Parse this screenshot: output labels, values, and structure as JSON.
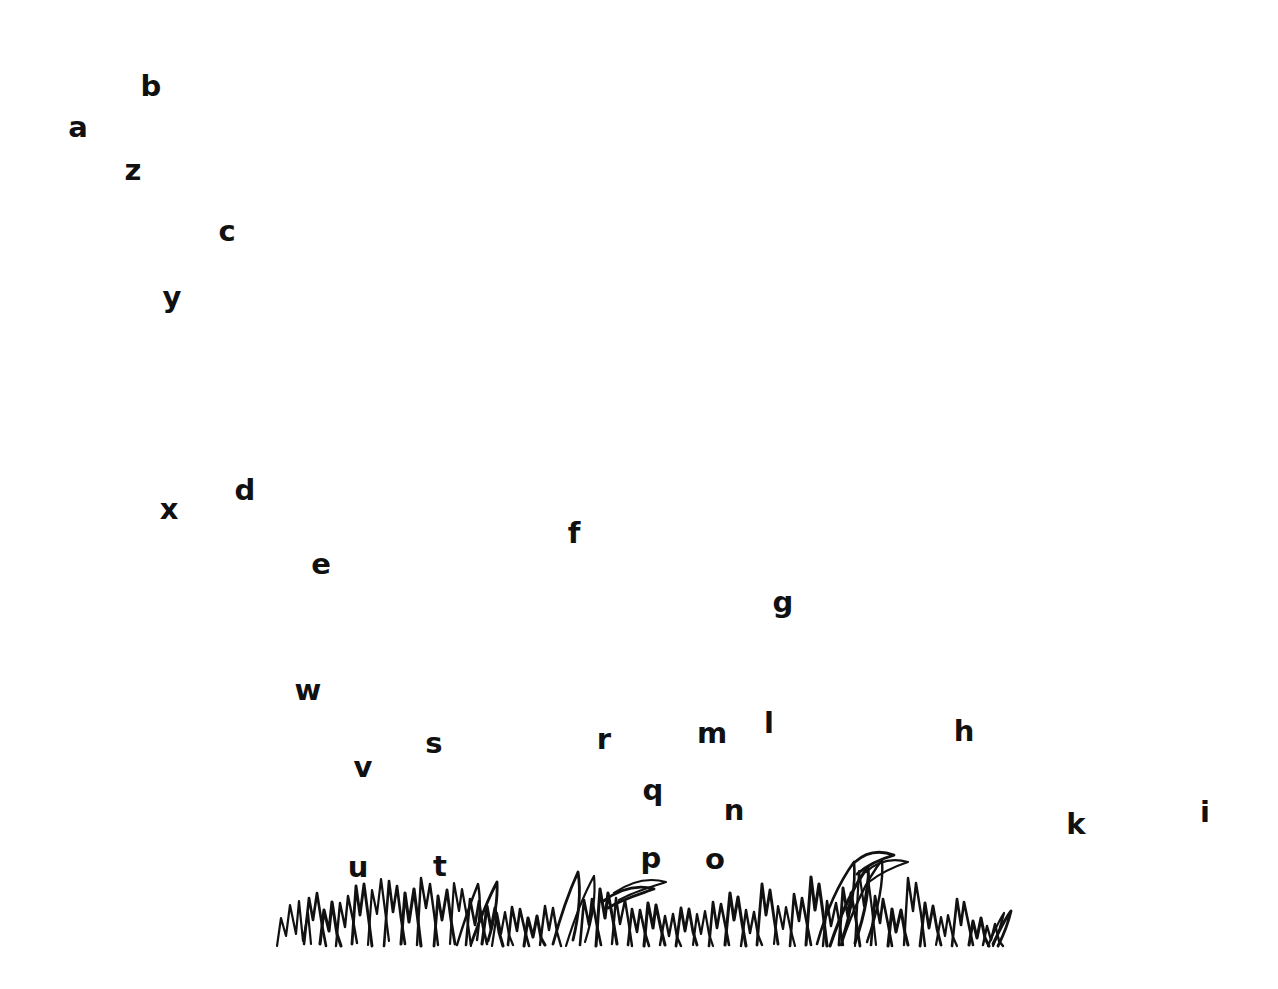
{
  "image": {
    "title": "Hand-drawn grass sketch with scattered alphabet labels",
    "background_color": "#ffffff",
    "ink_color": "#111111",
    "width": 1278,
    "height": 989
  },
  "letters": [
    {
      "label": "b",
      "x": 151,
      "y": 86
    },
    {
      "label": "a",
      "x": 78,
      "y": 127
    },
    {
      "label": "z",
      "x": 133,
      "y": 170
    },
    {
      "label": "c",
      "x": 227,
      "y": 231
    },
    {
      "label": "y",
      "x": 172,
      "y": 297
    },
    {
      "label": "d",
      "x": 245,
      "y": 490
    },
    {
      "label": "x",
      "x": 169,
      "y": 509
    },
    {
      "label": "f",
      "x": 574,
      "y": 533
    },
    {
      "label": "e",
      "x": 321,
      "y": 564
    },
    {
      "label": "g",
      "x": 783,
      "y": 602
    },
    {
      "label": "w",
      "x": 308,
      "y": 690
    },
    {
      "label": "l",
      "x": 769,
      "y": 723
    },
    {
      "label": "h",
      "x": 964,
      "y": 731
    },
    {
      "label": "m",
      "x": 712,
      "y": 733
    },
    {
      "label": "r",
      "x": 604,
      "y": 739
    },
    {
      "label": "s",
      "x": 434,
      "y": 743
    },
    {
      "label": "v",
      "x": 363,
      "y": 767
    },
    {
      "label": "q",
      "x": 653,
      "y": 790
    },
    {
      "label": "n",
      "x": 734,
      "y": 810
    },
    {
      "label": "i",
      "x": 1205,
      "y": 812
    },
    {
      "label": "k",
      "x": 1076,
      "y": 824
    },
    {
      "label": "p",
      "x": 651,
      "y": 858
    },
    {
      "label": "o",
      "x": 715,
      "y": 859
    },
    {
      "label": "u",
      "x": 358,
      "y": 867
    },
    {
      "label": "t",
      "x": 440,
      "y": 866
    }
  ],
  "grass": {
    "name": "grass-tuft-drawing",
    "stroke_color": "#111111",
    "baseline_y": 945,
    "x_start": 277,
    "x_end": 1012,
    "description": "Hand-inked clump of grass blades spanning the lower-centre of the page",
    "blades": [
      "M277,946 L281,918 L286,936 L290,905 L296,934 L299,901 L303,941 L308,913 L311,944",
      "M304,944 L309,898 L313,920 L317,893 L322,925 L326,946",
      "M320,944 L324,910 L329,931 L332,902 L337,934 L341,946",
      "M336,946 L340,903 L345,927 L348,896 L353,920 L357,943",
      "M352,944 L356,886 L360,915 L364,884 L369,922 L372,946",
      "M368,945 L372,890 L377,914 L381,879 L385,910 L389,941",
      "M384,946 L389,881 L393,912 L397,886 L401,918 L405,944",
      "M401,944 L405,893 L409,922 L414,889 L418,921 L421,946",
      "M417,945 L421,878 L426,908 L430,884 L434,913 L438,945",
      "M434,946 L438,896 L442,920 L447,890 L451,920 L455,944",
      "M450,944 L454,883 L459,911 L462,889 L467,917 L471,946",
      "M466,945 L470,899 L475,925 L479,901 L483,927 L487,944",
      "M482,944 L487,906 L491,929 L495,908 L499,932 L503,946",
      "M457,945 C463,925 470,904 478,884 C481,899 480,918 477,940",
      "M471,944 C479,922 487,901 497,882 C498,900 494,921 488,941",
      "M492,946 L497,913 L501,934 L505,912 L509,935 L513,945",
      "M508,945 L512,907 L517,931 L520,909 L525,931 L529,946",
      "M524,946 L528,918 L533,937 L537,916 L541,938 L545,945",
      "M540,945 L545,906 L549,930 L553,908 L557,932 L561,946",
      "M553,944 C560,918 568,894 578,872 C581,891 579,915 573,940",
      "M566,946 C574,920 583,896 594,876 C596,896 592,920 585,942",
      "M580,945 L584,900 L589,925 L592,899 L597,926 L601,945",
      "M596,946 L600,889 L605,918 L608,893 L613,920 L617,944",
      "M612,944 L616,898 L620,924 L625,900 L629,925 L632,946",
      "M602,902 C618,890 636,884 654,889 C640,894 622,899 608,908",
      "M614,893 C630,882 648,877 666,882 C651,887 633,892 619,900",
      "M628,945 L632,909 L637,932 L640,910 L645,933 L649,946",
      "M644,946 L648,903 L653,928 L656,905 L661,929 L665,945",
      "M660,945 L665,916 L669,936 L673,914 L677,937 L681,946",
      "M676,946 L681,908 L685,931 L689,909 L693,932 L697,945",
      "M693,945 L697,914 L701,934 L705,911 L709,934 L713,946",
      "M709,946 L713,902 L717,928 L721,904 L726,929 L729,945",
      "M725,945 L730,893 L734,920 L738,897 L742,923 L746,946",
      "M741,946 L746,910 L750,933 L754,912 L758,935 L762,945",
      "M757,945 L762,884 L766,915 L770,890 L774,918 L778,944",
      "M774,944 L778,906 L783,929 L786,907 L791,931 L795,946",
      "M790,946 L794,894 L799,921 L802,898 L807,924 L811,945",
      "M806,945 L811,877 L815,910 L819,884 L823,913 L827,946",
      "M823,946 L827,901 L831,926 L836,903 L840,927 L843,945",
      "M839,945 L843,888 L848,917 L851,893 L856,920 L860,946",
      "M855,946 L859,871 L864,906 L868,878 L872,909 L876,945",
      "M817,944 C826,912 838,884 854,862 C856,885 851,912 842,940",
      "M830,946 C840,916 852,888 868,867 C870,890 864,917 855,943",
      "M841,945 C852,912 865,882 882,860 C884,884 877,913 867,942",
      "M855,862 C866,852 880,850 894,855 C880,859 866,866 857,874",
      "M866,872 C878,861 893,858 908,862 C893,867 879,874 869,882",
      "M871,945 L875,896 L880,923 L883,899 L888,924 L892,946",
      "M888,946 L892,909 L896,932 L901,910 L905,933 L908,945",
      "M904,945 L908,878 L913,911 L916,883 L921,914 L925,946",
      "M920,946 L925,903 L929,928 L933,906 L937,929 L941,945",
      "M936,945 L941,917 L945,936 L948,915 L953,937 L957,946",
      "M952,946 L957,899 L961,925 L964,902 L969,926 L973,945",
      "M969,945 L973,921 L977,938 L981,918 L985,938 L989,946",
      "M983,945 L987,926 L991,940 L995,924 L999,941 L1003,946",
      "M993,944 C999,932 1004,920 1011,911 C1008,924 1003,936 998,946",
      "M988,946 C993,934 998,922 1004,913 C1001,926 997,937 993,946"
    ]
  }
}
